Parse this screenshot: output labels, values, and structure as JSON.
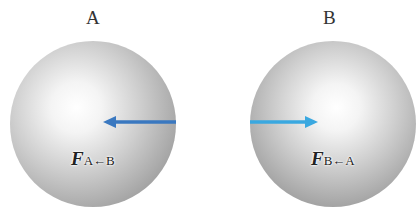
{
  "objects": [
    {
      "name": "A",
      "label": "A"
    },
    {
      "name": "B",
      "label": "B"
    }
  ],
  "forces": [
    {
      "symbol": "F",
      "subscript": "A←B",
      "direction": "left",
      "color": "#3a78c0"
    },
    {
      "symbol": "F",
      "subscript": "B←A",
      "direction": "right",
      "color": "#3aa8e0"
    }
  ]
}
